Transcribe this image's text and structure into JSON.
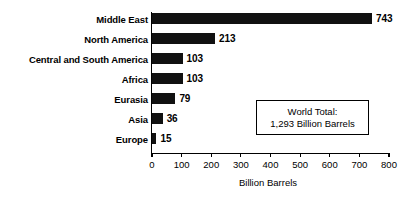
{
  "chart_data": {
    "type": "bar",
    "orientation": "horizontal",
    "title": "",
    "xlabel": "Billion Barrels",
    "ylabel": "",
    "categories": [
      "Middle East",
      "North America",
      "Central and South America",
      "Africa",
      "Eurasia",
      "Asia",
      "Europe"
    ],
    "values": [
      743,
      213,
      103,
      103,
      79,
      36,
      15
    ],
    "value_labels": [
      "743",
      "213",
      "103",
      "103",
      "79",
      "36",
      "15"
    ],
    "xlim": [
      0,
      800
    ],
    "xticks": [
      0,
      100,
      200,
      300,
      400,
      500,
      600,
      700,
      800
    ],
    "xtick_labels": [
      "0",
      "100",
      "200",
      "300",
      "400",
      "500",
      "600",
      "700",
      "800"
    ],
    "grid": false,
    "legend": false,
    "bar_color": "#111111",
    "annotation": {
      "line1": "World Total:",
      "line2": "1,293 Billion Barrels"
    }
  }
}
